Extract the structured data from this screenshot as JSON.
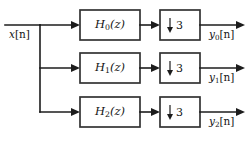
{
  "diagram": {
    "type": "block-diagram",
    "background_color": "#ffffff",
    "line_color": "#1c1c1c",
    "box_stroke_color": "#333333",
    "input": {
      "label_base": "x",
      "label_bracket": "[n]"
    },
    "branches": [
      {
        "filter": {
          "base": "H",
          "sub": "0",
          "arg": "(z)"
        },
        "decimator": {
          "arrow": "↓",
          "factor": "3"
        },
        "output": {
          "base": "y",
          "sub": "0",
          "bracket": "[n]"
        }
      },
      {
        "filter": {
          "base": "H",
          "sub": "1",
          "arg": "(z)"
        },
        "decimator": {
          "arrow": "↓",
          "factor": "3"
        },
        "output": {
          "base": "y",
          "sub": "1",
          "bracket": "[n]"
        }
      },
      {
        "filter": {
          "base": "H",
          "sub": "2",
          "arg": "(z)"
        },
        "decimator": {
          "arrow": "↓",
          "factor": "3"
        },
        "output": {
          "base": "y",
          "sub": "2",
          "bracket": "[n]"
        }
      }
    ]
  }
}
